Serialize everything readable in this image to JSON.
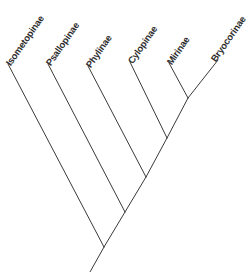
{
  "figure": {
    "type": "cladogram",
    "width": 250,
    "height": 272,
    "background_color": "#ffffff",
    "line_color": "#3a3a3a",
    "label_color": "#2e2e2e",
    "label_rotation_deg": -55
  },
  "taxa": [
    {
      "id": "isometopinae",
      "label": "Isometopinae",
      "label_x": 8,
      "label_y": 60,
      "tip_x": 8,
      "tip_y": 64
    },
    {
      "id": "psallopinae",
      "label": "Psallopinae",
      "label_x": 48,
      "label_y": 60,
      "tip_x": 48,
      "tip_y": 64
    },
    {
      "id": "phylinae",
      "label": "Phylinae",
      "label_x": 88,
      "label_y": 62,
      "tip_x": 88,
      "tip_y": 66
    },
    {
      "id": "cylapinae",
      "label": "Cylopinae",
      "label_x": 130,
      "label_y": 58,
      "tip_x": 130,
      "tip_y": 62
    },
    {
      "id": "mirinae",
      "label": "Mirinae",
      "label_x": 169,
      "label_y": 59,
      "tip_x": 169,
      "tip_y": 63
    },
    {
      "id": "bryocorinae",
      "label": "Bryocorinae",
      "label_x": 213,
      "label_y": 56,
      "tip_x": 218,
      "tip_y": 60
    }
  ],
  "nodes": [
    {
      "id": "node-mirinae-bryocorinae",
      "x": 188,
      "y": 98
    },
    {
      "id": "node-cylapinae-clade",
      "x": 167,
      "y": 138
    },
    {
      "id": "node-phylinae-clade",
      "x": 146,
      "y": 177
    },
    {
      "id": "node-psallopinae-clade",
      "x": 125,
      "y": 212
    },
    {
      "id": "node-root",
      "x": 104,
      "y": 247
    }
  ],
  "branches": [
    {
      "id": "branch-isometopinae",
      "x1": 8,
      "y1": 64,
      "x2": 104,
      "y2": 247
    },
    {
      "id": "branch-psallopinae",
      "x1": 48,
      "y1": 64,
      "x2": 125,
      "y2": 212
    },
    {
      "id": "branch-phylinae",
      "x1": 88,
      "y1": 66,
      "x2": 146,
      "y2": 177
    },
    {
      "id": "branch-cylapinae",
      "x1": 130,
      "y1": 62,
      "x2": 167,
      "y2": 138
    },
    {
      "id": "branch-mirinae",
      "x1": 169,
      "y1": 63,
      "x2": 188,
      "y2": 98
    },
    {
      "id": "branch-bryocorinae",
      "x1": 218,
      "y1": 60,
      "x2": 188,
      "y2": 98
    },
    {
      "id": "branch-internal-mirinae-bryocorinae",
      "x1": 188,
      "y1": 98,
      "x2": 167,
      "y2": 138
    },
    {
      "id": "branch-internal-cylapinae-clade",
      "x1": 167,
      "y1": 138,
      "x2": 146,
      "y2": 177
    },
    {
      "id": "branch-internal-phylinae-clade",
      "x1": 146,
      "y1": 177,
      "x2": 125,
      "y2": 212
    },
    {
      "id": "branch-internal-psallopinae-clade",
      "x1": 125,
      "y1": 212,
      "x2": 104,
      "y2": 247
    },
    {
      "id": "branch-root-stem",
      "x1": 104,
      "y1": 247,
      "x2": 90,
      "y2": 272
    }
  ]
}
